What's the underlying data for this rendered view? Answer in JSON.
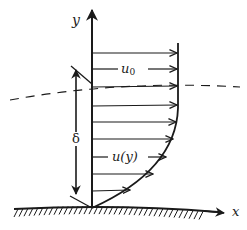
{
  "diagram": {
    "labels": {
      "y_axis": "y",
      "x_axis": "x",
      "free_stream_velocity": "u₀",
      "free_stream_base": "u",
      "free_stream_sub": "0",
      "profile_velocity": "u(y)",
      "thickness": "δ"
    },
    "colors": {
      "stroke": "#1a1a1a",
      "background": "#ffffff"
    },
    "elements": [
      "y-axis arrow",
      "x-axis arrow along wall",
      "hatched wall surface",
      "dashed boundary-layer edge",
      "velocity profile curve",
      "9 horizontal velocity arrows",
      "boundary-layer thickness dimension arrow"
    ]
  }
}
